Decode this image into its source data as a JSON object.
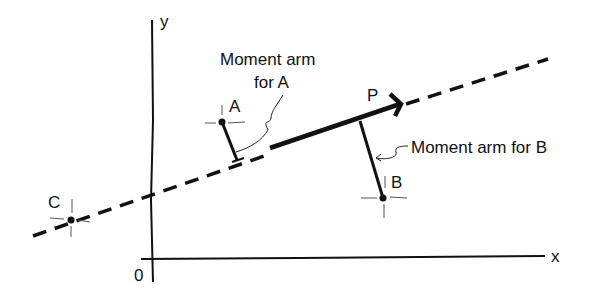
{
  "diagram": {
    "axes": {
      "x_label": "x",
      "y_label": "y",
      "origin_label": "0"
    },
    "force": {
      "label": "P"
    },
    "points": [
      {
        "id": "A",
        "label": "A"
      },
      {
        "id": "B",
        "label": "B"
      },
      {
        "id": "C",
        "label": "C"
      }
    ],
    "annotations": {
      "arm_a_line1": "Moment arm",
      "arm_a_line2": "for A",
      "arm_b": "Moment arm for B"
    },
    "colors": {
      "ink": "#111111",
      "background": "#ffffff"
    }
  }
}
